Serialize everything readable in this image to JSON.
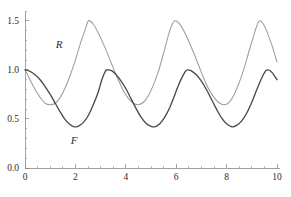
{
  "chart_data": {
    "type": "line",
    "title": "",
    "subtitle": "",
    "xlabel": "",
    "ylabel": "",
    "xlim": [
      0,
      10
    ],
    "ylim": [
      0.0,
      1.6
    ],
    "grid": false,
    "legend_position": "inline-annotation",
    "x_ticks_major": [
      0,
      2,
      4,
      6,
      8,
      10
    ],
    "x_ticks_major_labels": [
      "0",
      "2",
      "4",
      "6",
      "8",
      "10"
    ],
    "x_ticks_minor": [
      0.5,
      1,
      1.5,
      2.5,
      3,
      3.5,
      4.5,
      5,
      5.5,
      6.5,
      7,
      7.5,
      8.5,
      9,
      9.5
    ],
    "y_ticks_major": [
      0.0,
      0.5,
      1.0,
      1.5
    ],
    "y_ticks_major_labels": [
      "0.0",
      "0.5",
      "1.0",
      "1.5"
    ],
    "y_ticks_minor": [
      0.1,
      0.2,
      0.3,
      0.4,
      0.6,
      0.7,
      0.8,
      0.9,
      1.1,
      1.2,
      1.3,
      1.4,
      1.6
    ],
    "annotations": [
      {
        "text": "R",
        "x": 1.35,
        "y": 1.22
      },
      {
        "text": "F",
        "x": 1.95,
        "y": 0.24
      }
    ],
    "series": [
      {
        "name": "R",
        "label": "R",
        "color": "#9c9c9c",
        "linewidth": 1.05,
        "description": "Prey population: starts at 1.0, dips to about 0.64, peaks at 1.5, period about 3.2",
        "model": {
          "mean": 1.07,
          "amplitude": 0.43,
          "period": 3.2,
          "phase_x_of_first_peak": 2.52,
          "start_value": 1.0
        },
        "points": [
          [
            0.0,
            1.0
          ],
          [
            0.2,
            0.9
          ],
          [
            0.4,
            0.8
          ],
          [
            0.6,
            0.72
          ],
          [
            0.8,
            0.66
          ],
          [
            1.0,
            0.645
          ],
          [
            1.2,
            0.66
          ],
          [
            1.4,
            0.72
          ],
          [
            1.6,
            0.82
          ],
          [
            1.8,
            0.95
          ],
          [
            2.0,
            1.1
          ],
          [
            2.2,
            1.27
          ],
          [
            2.4,
            1.42
          ],
          [
            2.52,
            1.5
          ],
          [
            2.7,
            1.47
          ],
          [
            2.9,
            1.38
          ],
          [
            3.1,
            1.27
          ],
          [
            3.3,
            1.15
          ],
          [
            3.5,
            1.02
          ],
          [
            3.7,
            0.9
          ],
          [
            3.9,
            0.79
          ],
          [
            4.1,
            0.71
          ],
          [
            4.3,
            0.66
          ],
          [
            4.5,
            0.645
          ],
          [
            4.7,
            0.67
          ],
          [
            4.9,
            0.74
          ],
          [
            5.1,
            0.85
          ],
          [
            5.3,
            0.99
          ],
          [
            5.5,
            1.17
          ],
          [
            5.72,
            1.38
          ],
          [
            5.85,
            1.47
          ],
          [
            5.95,
            1.5
          ],
          [
            6.1,
            1.48
          ],
          [
            6.3,
            1.4
          ],
          [
            6.5,
            1.29
          ],
          [
            6.7,
            1.17
          ],
          [
            6.9,
            1.04
          ],
          [
            7.1,
            0.91
          ],
          [
            7.3,
            0.8
          ],
          [
            7.5,
            0.72
          ],
          [
            7.7,
            0.665
          ],
          [
            7.9,
            0.645
          ],
          [
            8.1,
            0.67
          ],
          [
            8.3,
            0.75
          ],
          [
            8.5,
            0.87
          ],
          [
            8.7,
            1.02
          ],
          [
            8.9,
            1.2
          ],
          [
            9.1,
            1.37
          ],
          [
            9.2,
            1.45
          ],
          [
            9.3,
            1.5
          ],
          [
            9.45,
            1.47
          ],
          [
            9.6,
            1.39
          ],
          [
            9.8,
            1.25
          ],
          [
            10.0,
            1.08
          ]
        ]
      },
      {
        "name": "F",
        "label": "F",
        "color": "#4a4a4a",
        "linewidth": 1.35,
        "description": "Predator population: starts at 1.0, troughs at about 0.42, peaks at 1.0, period about 3.2",
        "model": {
          "mean": 0.71,
          "amplitude": 0.29,
          "period": 3.2,
          "phase_x_of_first_peak": 3.2,
          "start_value": 1.0
        },
        "points": [
          [
            0.0,
            1.0
          ],
          [
            0.2,
            0.985
          ],
          [
            0.4,
            0.95
          ],
          [
            0.6,
            0.9
          ],
          [
            0.8,
            0.83
          ],
          [
            1.0,
            0.75
          ],
          [
            1.2,
            0.66
          ],
          [
            1.4,
            0.57
          ],
          [
            1.6,
            0.49
          ],
          [
            1.8,
            0.44
          ],
          [
            1.95,
            0.42
          ],
          [
            2.1,
            0.425
          ],
          [
            2.3,
            0.46
          ],
          [
            2.5,
            0.53
          ],
          [
            2.7,
            0.64
          ],
          [
            2.9,
            0.77
          ],
          [
            3.05,
            0.9
          ],
          [
            3.2,
            0.99
          ],
          [
            3.3,
            1.0
          ],
          [
            3.45,
            0.99
          ],
          [
            3.6,
            0.955
          ],
          [
            3.8,
            0.89
          ],
          [
            4.0,
            0.81
          ],
          [
            4.2,
            0.71
          ],
          [
            4.4,
            0.61
          ],
          [
            4.6,
            0.52
          ],
          [
            4.8,
            0.455
          ],
          [
            5.0,
            0.425
          ],
          [
            5.15,
            0.42
          ],
          [
            5.35,
            0.45
          ],
          [
            5.55,
            0.52
          ],
          [
            5.75,
            0.62
          ],
          [
            5.95,
            0.75
          ],
          [
            6.15,
            0.88
          ],
          [
            6.35,
            0.98
          ],
          [
            6.45,
            1.0
          ],
          [
            6.6,
            0.99
          ],
          [
            6.8,
            0.95
          ],
          [
            7.0,
            0.885
          ],
          [
            7.2,
            0.8
          ],
          [
            7.4,
            0.7
          ],
          [
            7.6,
            0.6
          ],
          [
            7.8,
            0.51
          ],
          [
            8.0,
            0.45
          ],
          [
            8.2,
            0.42
          ],
          [
            8.4,
            0.435
          ],
          [
            8.6,
            0.48
          ],
          [
            8.8,
            0.56
          ],
          [
            9.0,
            0.67
          ],
          [
            9.2,
            0.8
          ],
          [
            9.4,
            0.92
          ],
          [
            9.55,
            0.99
          ],
          [
            9.65,
            1.0
          ],
          [
            9.8,
            0.975
          ],
          [
            10.0,
            0.9
          ]
        ]
      }
    ]
  },
  "colors": {
    "background": "#ffffff",
    "axis": "#8a8a8a",
    "text": "#2b2b2b",
    "series_r": "#9c9c9c",
    "series_f": "#4a4a4a"
  }
}
